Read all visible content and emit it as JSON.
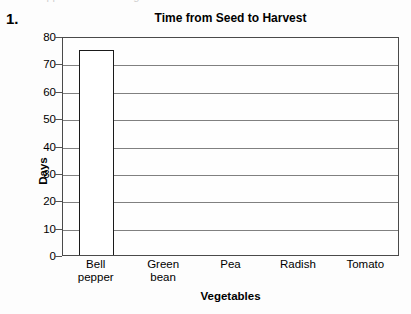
{
  "item_number": "1.",
  "ghost_text": "clipped text above figure",
  "chart_data": {
    "type": "bar",
    "title": "Time from Seed to Harvest",
    "xlabel": "Vegetables",
    "ylabel": "Days",
    "categories": [
      "Bell pepper",
      "Green bean",
      "Pea",
      "Radish",
      "Tomato"
    ],
    "category_lines": [
      [
        "Bell",
        "pepper"
      ],
      [
        "Green",
        "bean"
      ],
      [
        "Pea",
        ""
      ],
      [
        "Radish",
        ""
      ],
      [
        "Tomato",
        ""
      ]
    ],
    "values": [
      75,
      null,
      null,
      null,
      null
    ],
    "ylim": [
      0,
      80
    ],
    "ytick_step": 10,
    "yticks": [
      "80",
      "70",
      "60",
      "50",
      "40",
      "30",
      "20",
      "10",
      "0"
    ],
    "grid": "horizontal",
    "legend": "none",
    "bar_fill_color": "#ffffff",
    "bar_border_color": "#1a1a1a",
    "gridline_color": "#808080",
    "frame_color": "#4a4a4a",
    "note": "Only the Bell pepper bar is drawn; remaining bars are blank for the student to complete."
  }
}
